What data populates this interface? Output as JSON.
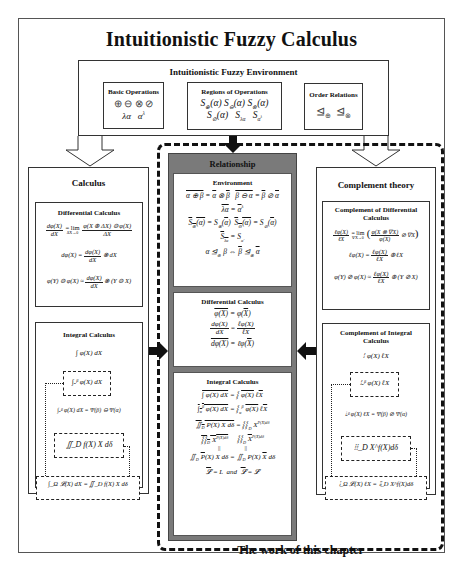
{
  "title": "Intuitionistic Fuzzy Calculus",
  "environment": {
    "title": "Intuitionistic Fuzzy Environment",
    "basic_operations": {
      "title": "Basic Operations",
      "row1": "⊕   ⊖   ⊗   ⊘",
      "row2": "λα    α^λ"
    },
    "regions_of_operations": {
      "title": "Regions of Operations",
      "row1": "𝓢⊕(α) 𝓢⊖(α) 𝓢⊗(α)",
      "row2": "𝓢⊘(α)   𝓢λα    𝓢α^λ"
    },
    "order_relations": {
      "title": "Order Relations",
      "row1": "⊴⊕   ⊴⊗"
    }
  },
  "calculus": {
    "title": "Calculus",
    "differential": {
      "title": "Differential Calculus",
      "eq1_lhs_num": "dφ(X)",
      "eq1_lhs_den": "dX",
      "eq1_mid": "= lim",
      "eq1_lim_sub": "ΔX→0",
      "eq1_rhs_num": "φ(X ⊕ ΔX) ⊖ φ(X)",
      "eq1_rhs_den": "ΔX",
      "eq2_lhs": "dφ(X) =",
      "eq2_num": "dφ(X)",
      "eq2_den": "dX",
      "eq2_rhs": "⊗ dX",
      "eq3_lhs": "φ(Y) ⊖ φ(X) ≈",
      "eq3_num": "dφ(X)",
      "eq3_den": "dX",
      "eq3_rhs": "⊗ (Y ⊖ X)"
    },
    "integral": {
      "title": "Integral Calculus",
      "eq1": "∫ φ(X) dX",
      "eq2": "∫ₐᵝ φ(X) dX",
      "eq3": "∫ₐᵝ φ(X) dX = Ψ(β) ⊖ Ψ(α)",
      "eq4": "∬_D f(X) X dδ",
      "eq5": "∫_Ω 𝓛(X) dX = ∬_D f(X) X dδ"
    }
  },
  "relationship": {
    "title": "Relationship",
    "environment": {
      "title": "Environment",
      "eq1a": "α ⊕ β = α ⊗ β",
      "eq1b": "β ⊖ α = β ⊘ α",
      "eq2": "λα = α^λ",
      "eq3a": "𝓢⊕(α) = 𝓢⊗(α)",
      "eq3b": "𝓢⊖(α) = 𝓢⊘(α)",
      "eq4": "𝓢λα = 𝓢α^λ",
      "eq5": "α ⊴⊕ β ⇔ β ⊴⊗ α"
    },
    "differential": {
      "title": "Differential Calculus",
      "eq1": "φ(X) = φ(X)",
      "eq2_lnum": "dφ(X)",
      "eq2_lden": "dX",
      "eq2_rnum": "ℓφ(X)",
      "eq2_rden": "ℓX",
      "eq3": "dφ(X) = ℓφ(X)"
    },
    "integral": {
      "title": "Integral Calculus",
      "eq1": "∫ φ(X) dX = ⦙ φ(X) ℓX",
      "eq2": "∫ₐᵝ φ(X) dX = ⦙ φ(X) ℓX",
      "eq3": "∬_D P(X) X dδ = ⦙⦙_D X^P(X)dδ",
      "eq4a": "⦙⦙_D X^P(X)dδ",
      "eq4b": "⦙⦙_D X^P(X)dδ",
      "eq4_mid": "||",
      "eq5": "∬_D P(X) X dδ = ∬_D P(X) X dδ",
      "eq6": "𝓛 = L   and   𝓛 = 𝓛"
    }
  },
  "complement": {
    "title": "Complement theory",
    "differential": {
      "title": "Complement of Differential Calculus",
      "eq1_lhs_num": "ℓφ(X)",
      "eq1_lhs_den": "ℓX",
      "eq1_mid": "= lim",
      "eq1_lim_sub": "∇X→0",
      "eq1_rhs_num": "φ(X ⊗ ∇X)",
      "eq1_rhs_den": "φ(X)",
      "eq1_tail": "⊘ ∇X",
      "eq2_lhs": "ℓφ(X) =",
      "eq2_num": "ℓφ(X)",
      "eq2_den": "ℓX",
      "eq2_rhs": "⊕ ℓX",
      "eq3_lhs": "φ(Y) ⊘ φ(X) ≈",
      "eq3_num": "ℓφ(X)",
      "eq3_den": "ℓX",
      "eq3_rhs": "⊕ (Y ⊘ X)"
    },
    "integral": {
      "title": "Complement of Integral Calculus",
      "eq1": "⦙ φ(X) ℓX",
      "eq2": "⦙ₐᵝ φ(X) ℓX",
      "eq3": "⦙ₐᵝ φ(X) ℓX = Ψ(β) ⊘ Ψ(α)",
      "eq4": "⦙⦙_D X^f(X)dδ",
      "eq5": "⦙_Ω 𝓛(X) ℓX = ⦙⦙_D X^f(X)dδ"
    }
  },
  "footer": "The work of this chapter",
  "colors": {
    "relationship_bg": "#7a7a7a",
    "border": "#333333",
    "background": "#ffffff"
  }
}
